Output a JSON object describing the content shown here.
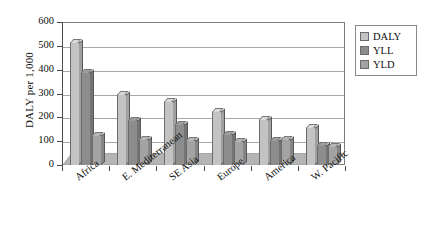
{
  "chart_data": {
    "type": "bar",
    "title": "",
    "subtitle": "",
    "xlabel": "",
    "ylabel": "DALY per 1,000",
    "ylim": [
      0,
      600
    ],
    "ytick_step": 100,
    "yticks": [
      "600",
      "500",
      "400",
      "300",
      "200",
      "100",
      "0"
    ],
    "grid": true,
    "grid_axis": "y",
    "legend_position": "right-top",
    "categories": [
      "Africa",
      "E. Mediterranean",
      "SE Asia",
      "Europe",
      "America",
      "W. Pacific"
    ],
    "series": [
      {
        "name": "DALY",
        "color": "#c3c3c3",
        "values": [
          515,
          297,
          270,
          225,
          195,
          160
        ]
      },
      {
        "name": "YLL",
        "color": "#8d8d8d",
        "values": [
          390,
          190,
          170,
          130,
          105,
          85
        ]
      },
      {
        "name": "YLD",
        "color": "#a3a3a3",
        "values": [
          125,
          108,
          105,
          100,
          110,
          80
        ]
      }
    ]
  },
  "legend": {
    "items": [
      {
        "label": "DALY",
        "color": "#c3c3c3"
      },
      {
        "label": "YLL",
        "color": "#8d8d8d"
      },
      {
        "label": "YLD",
        "color": "#a3a3a3"
      }
    ]
  },
  "colors": {
    "background": "#ffffff",
    "axis": "#4a4a4a",
    "frame": "#7d7d7d",
    "gridline": "#a8a8a8",
    "bar_outline": "#6b6b6b",
    "floor": "#b5b5b5",
    "text": "#111111"
  }
}
